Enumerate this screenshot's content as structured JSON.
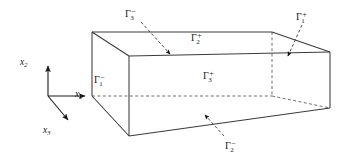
{
  "figure": {
    "background_color": "#ffffff",
    "line_color": "#3b3b3b",
    "text_color": "#1a1a1a"
  },
  "axes": {
    "origin": {
      "x": 48,
      "y": 96
    },
    "items": [
      {
        "name": "x-2-axis",
        "base": "x",
        "sub": "2",
        "label_x": 20,
        "label_y": 58,
        "tip_x": 48,
        "tip_y": 64
      },
      {
        "name": "x-1-axis",
        "base": "x",
        "sub": "1",
        "label_x": 75,
        "label_y": 90,
        "tip_x": 88,
        "tip_y": 96
      },
      {
        "name": "x-3-axis",
        "base": "x",
        "sub": "3",
        "label_x": 43,
        "label_y": 126,
        "tip_x": 70,
        "tip_y": 122
      }
    ]
  },
  "box": {
    "vertices": {
      "back_top_left": {
        "x": 92,
        "y": 32
      },
      "back_top_right": {
        "x": 272,
        "y": 32
      },
      "front_top_left": {
        "x": 129,
        "y": 56
      },
      "front_top_right": {
        "x": 330,
        "y": 52
      },
      "back_bottom_left": {
        "x": 92,
        "y": 96
      },
      "back_bottom_right": {
        "x": 272,
        "y": 96
      },
      "front_bottom_left": {
        "x": 129,
        "y": 136
      },
      "front_bottom_right": {
        "x": 330,
        "y": 108
      }
    }
  },
  "boundary_labels": [
    {
      "name": "gamma-3-minus",
      "base": "Γ",
      "sub": "3",
      "sup": "−",
      "label_x": 125,
      "label_y": 8,
      "arrow": {
        "x1": 141,
        "y1": 22,
        "x2": 172,
        "y2": 56
      }
    },
    {
      "name": "gamma-2-plus",
      "base": "Γ",
      "sub": "2",
      "sup": "+",
      "label_x": 191,
      "label_y": 32,
      "arrow": null
    },
    {
      "name": "gamma-1-plus",
      "base": "Γ",
      "sub": "1",
      "sup": "+",
      "label_x": 296,
      "label_y": 11,
      "arrow": {
        "x1": 302,
        "y1": 25,
        "x2": 287,
        "y2": 58
      }
    },
    {
      "name": "gamma-1-minus",
      "base": "Γ",
      "sub": "1",
      "sup": "−",
      "label_x": 94,
      "label_y": 74,
      "arrow": null
    },
    {
      "name": "gamma-3-plus",
      "base": "Γ",
      "sub": "3",
      "sup": "+",
      "label_x": 203,
      "label_y": 70,
      "arrow": null
    },
    {
      "name": "gamma-2-minus",
      "base": "Γ",
      "sub": "2",
      "sup": "−",
      "label_x": 225,
      "label_y": 140,
      "arrow": {
        "x1": 224,
        "y1": 136,
        "x2": 203,
        "y2": 113
      }
    }
  ]
}
